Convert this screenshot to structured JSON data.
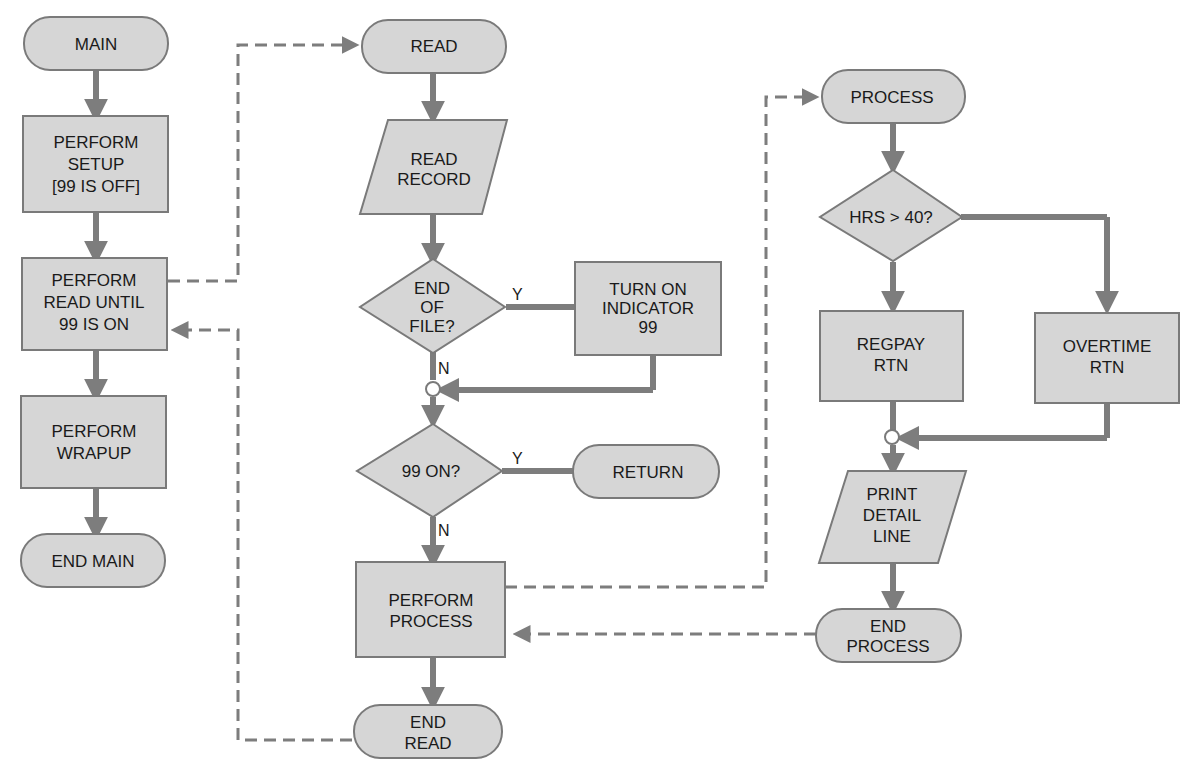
{
  "diagram": {
    "type": "flowchart",
    "columns": [
      {
        "name": "MAIN",
        "nodes": [
          {
            "id": "main",
            "shape": "terminal",
            "lines": [
              "MAIN"
            ]
          },
          {
            "id": "perform-setup",
            "shape": "process",
            "lines": [
              "PERFORM",
              "SETUP",
              "[99 IS OFF]"
            ]
          },
          {
            "id": "perform-read",
            "shape": "process",
            "lines": [
              "PERFORM",
              "READ UNTIL",
              "99 IS ON"
            ]
          },
          {
            "id": "perform-wrapup",
            "shape": "process",
            "lines": [
              "PERFORM",
              "WRAPUP"
            ]
          },
          {
            "id": "end-main",
            "shape": "terminal",
            "lines": [
              "END MAIN"
            ]
          }
        ]
      },
      {
        "name": "READ",
        "nodes": [
          {
            "id": "read",
            "shape": "terminal",
            "lines": [
              "READ"
            ]
          },
          {
            "id": "read-record",
            "shape": "io",
            "lines": [
              "READ",
              "RECORD"
            ]
          },
          {
            "id": "end-of-file",
            "shape": "decision",
            "lines": [
              "END",
              "OF",
              "FILE?"
            ]
          },
          {
            "id": "turn-on-indicator",
            "shape": "process",
            "lines": [
              "TURN ON",
              "INDICATOR",
              "99"
            ]
          },
          {
            "id": "99-on",
            "shape": "decision",
            "lines": [
              "99 ON?"
            ]
          },
          {
            "id": "return",
            "shape": "terminal",
            "lines": [
              "RETURN"
            ]
          },
          {
            "id": "perform-process",
            "shape": "process",
            "lines": [
              "PERFORM",
              "PROCESS"
            ]
          },
          {
            "id": "end-read",
            "shape": "terminal",
            "lines": [
              "END",
              "READ"
            ]
          }
        ]
      },
      {
        "name": "PROCESS",
        "nodes": [
          {
            "id": "process",
            "shape": "terminal",
            "lines": [
              "PROCESS"
            ]
          },
          {
            "id": "hrs-gt-40",
            "shape": "decision",
            "lines": [
              "HRS > 40?"
            ]
          },
          {
            "id": "regpay-rtn",
            "shape": "process",
            "lines": [
              "REGPAY",
              "RTN"
            ]
          },
          {
            "id": "overtime-rtn",
            "shape": "process",
            "lines": [
              "OVERTIME",
              "RTN"
            ]
          },
          {
            "id": "print-detail-line",
            "shape": "io",
            "lines": [
              "PRINT",
              "DETAIL",
              "LINE"
            ]
          },
          {
            "id": "end-process",
            "shape": "terminal",
            "lines": [
              "END",
              "PROCESS"
            ]
          }
        ]
      }
    ],
    "branch_labels": {
      "eof_yes": "Y",
      "eof_no": "N",
      "on99_yes": "Y",
      "on99_no": "N"
    },
    "colors": {
      "fill": "#d6d6d6",
      "stroke": "#7a7a7a",
      "line": "#7d7d7d",
      "text": "#1a1a1a",
      "background": "#ffffff"
    }
  }
}
